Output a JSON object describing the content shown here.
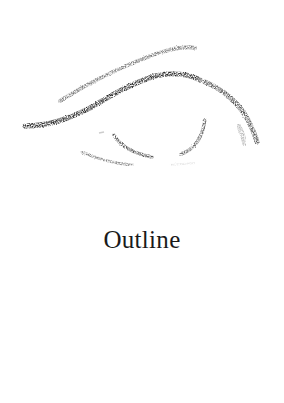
{
  "illustration": {
    "subject": "eye-outline-pencil-sketch",
    "stroke_color": "#3a3a3a",
    "background": "#ffffff"
  },
  "caption": {
    "text": "Outline"
  }
}
